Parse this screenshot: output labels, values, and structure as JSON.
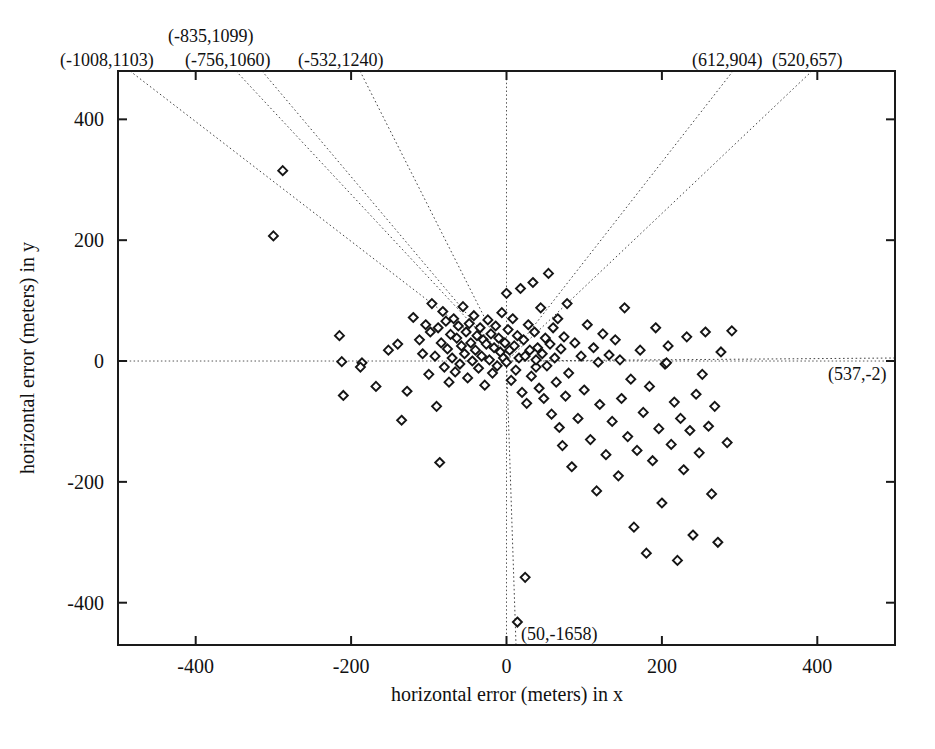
{
  "figure": {
    "name": "horizontal-error-scatter",
    "background": "#ffffff",
    "ink": "#111111"
  },
  "chart_data": {
    "type": "scatter",
    "title": "",
    "xlabel": "horizontal error (meters) in x",
    "ylabel": "horizontal error (meters) in y",
    "xlim": [
      -500,
      500
    ],
    "ylim": [
      -470,
      480
    ],
    "xticks": [
      -400,
      -200,
      0,
      200,
      400
    ],
    "yticks": [
      400,
      200,
      0,
      -200,
      -400
    ],
    "xticklabels": [
      "-400",
      "-200",
      "0",
      "200",
      "400"
    ],
    "yticklabels": [
      "400",
      "200",
      "0",
      "-200",
      "-400"
    ],
    "grid": false,
    "legend": null,
    "marker": "open-diamond",
    "marker_size": 9,
    "points": [
      [
        -300,
        207
      ],
      [
        -288,
        315
      ],
      [
        -215,
        42
      ],
      [
        -212,
        -1
      ],
      [
        -210,
        -57
      ],
      [
        -168,
        -42
      ],
      [
        -152,
        18
      ],
      [
        -140,
        28
      ],
      [
        -135,
        -98
      ],
      [
        -128,
        -50
      ],
      [
        -120,
        72
      ],
      [
        -112,
        35
      ],
      [
        -108,
        12
      ],
      [
        -104,
        60
      ],
      [
        -100,
        -22
      ],
      [
        -98,
        48
      ],
      [
        -96,
        95
      ],
      [
        -92,
        8
      ],
      [
        -90,
        -75
      ],
      [
        -88,
        55
      ],
      [
        -86,
        -168
      ],
      [
        -84,
        30
      ],
      [
        -82,
        82
      ],
      [
        -80,
        -10
      ],
      [
        -78,
        66
      ],
      [
        -76,
        20
      ],
      [
        -74,
        -35
      ],
      [
        -72,
        44
      ],
      [
        -70,
        5
      ],
      [
        -68,
        70
      ],
      [
        -66,
        -18
      ],
      [
        -64,
        38
      ],
      [
        -62,
        58
      ],
      [
        -60,
        -5
      ],
      [
        -58,
        25
      ],
      [
        -56,
        90
      ],
      [
        -54,
        12
      ],
      [
        -52,
        48
      ],
      [
        -50,
        -28
      ],
      [
        -48,
        62
      ],
      [
        -46,
        30
      ],
      [
        -44,
        0
      ],
      [
        -42,
        75
      ],
      [
        -40,
        18
      ],
      [
        -38,
        42
      ],
      [
        -36,
        -12
      ],
      [
        -34,
        55
      ],
      [
        -32,
        8
      ],
      [
        -30,
        35
      ],
      [
        -28,
        -40
      ],
      [
        -26,
        28
      ],
      [
        -24,
        68
      ],
      [
        -22,
        2
      ],
      [
        -20,
        45
      ],
      [
        -18,
        -20
      ],
      [
        -16,
        22
      ],
      [
        -14,
        58
      ],
      [
        -12,
        -8
      ],
      [
        -10,
        38
      ],
      [
        -8,
        15
      ],
      [
        -6,
        80
      ],
      [
        -4,
        5
      ],
      [
        -2,
        30
      ],
      [
        0,
        -2
      ],
      [
        0,
        112
      ],
      [
        2,
        52
      ],
      [
        4,
        18
      ],
      [
        6,
        -32
      ],
      [
        8,
        70
      ],
      [
        10,
        25
      ],
      [
        12,
        -15
      ],
      [
        14,
        42
      ],
      [
        16,
        5
      ],
      [
        18,
        120
      ],
      [
        20,
        -52
      ],
      [
        22,
        35
      ],
      [
        24,
        8
      ],
      [
        26,
        -70
      ],
      [
        28,
        60
      ],
      [
        30,
        18
      ],
      [
        32,
        -25
      ],
      [
        34,
        130
      ],
      [
        36,
        48
      ],
      [
        38,
        -10
      ],
      [
        40,
        22
      ],
      [
        42,
        -45
      ],
      [
        44,
        88
      ],
      [
        46,
        12
      ],
      [
        48,
        -62
      ],
      [
        50,
        38
      ],
      [
        52,
        -8
      ],
      [
        54,
        145
      ],
      [
        56,
        28
      ],
      [
        58,
        -88
      ],
      [
        60,
        55
      ],
      [
        62,
        5
      ],
      [
        64,
        -35
      ],
      [
        66,
        70
      ],
      [
        68,
        -110
      ],
      [
        70,
        20
      ],
      [
        72,
        -140
      ],
      [
        74,
        40
      ],
      [
        76,
        -58
      ],
      [
        78,
        95
      ],
      [
        80,
        -20
      ],
      [
        84,
        -175
      ],
      [
        88,
        30
      ],
      [
        92,
        -95
      ],
      [
        96,
        8
      ],
      [
        100,
        -48
      ],
      [
        104,
        60
      ],
      [
        108,
        -130
      ],
      [
        112,
        22
      ],
      [
        116,
        -215
      ],
      [
        120,
        -72
      ],
      [
        124,
        45
      ],
      [
        128,
        -155
      ],
      [
        132,
        10
      ],
      [
        136,
        -100
      ],
      [
        140,
        35
      ],
      [
        144,
        -190
      ],
      [
        148,
        -62
      ],
      [
        152,
        88
      ],
      [
        156,
        -125
      ],
      [
        160,
        -30
      ],
      [
        164,
        -275
      ],
      [
        168,
        -148
      ],
      [
        172,
        18
      ],
      [
        176,
        -85
      ],
      [
        180,
        -318
      ],
      [
        184,
        -42
      ],
      [
        188,
        -165
      ],
      [
        192,
        55
      ],
      [
        196,
        -112
      ],
      [
        200,
        -235
      ],
      [
        204,
        -5
      ],
      [
        208,
        25
      ],
      [
        212,
        -138
      ],
      [
        216,
        -68
      ],
      [
        220,
        -330
      ],
      [
        224,
        -95
      ],
      [
        228,
        -180
      ],
      [
        232,
        40
      ],
      [
        236,
        -115
      ],
      [
        240,
        -288
      ],
      [
        244,
        -55
      ],
      [
        248,
        -152
      ],
      [
        252,
        -22
      ],
      [
        256,
        48
      ],
      [
        260,
        -108
      ],
      [
        264,
        -220
      ],
      [
        268,
        -75
      ],
      [
        272,
        -300
      ],
      [
        276,
        15
      ],
      [
        284,
        -135
      ],
      [
        290,
        50
      ],
      [
        24,
        -358
      ],
      [
        14,
        -432
      ],
      [
        -186,
        -3
      ],
      [
        -188,
        -10
      ],
      [
        118,
        -2
      ],
      [
        206,
        -3
      ],
      [
        146,
        2
      ],
      [
        38,
        2
      ]
    ],
    "callouts": [
      {
        "text": "(-1008,1103)",
        "x": -1008,
        "y": 1103,
        "anchor_px_x": 60,
        "anchor_px_y": 66,
        "edge_x": 130,
        "edge_y": 71
      },
      {
        "text": "(-835,1099)",
        "x": -835,
        "y": 1099,
        "anchor_px_x": 168,
        "anchor_px_y": 42,
        "edge_x": 236,
        "edge_y": 71
      },
      {
        "text": "(-756,1060)",
        "x": -756,
        "y": 1060,
        "anchor_px_x": 185,
        "anchor_px_y": 66,
        "edge_x": 262,
        "edge_y": 71
      },
      {
        "text": "(-532,1240)",
        "x": -532,
        "y": 1240,
        "anchor_px_x": 298,
        "anchor_px_y": 66,
        "edge_x": 360,
        "edge_y": 71
      },
      {
        "text": "(612,904)",
        "x": 612,
        "y": 904,
        "anchor_px_x": 692,
        "anchor_px_y": 66,
        "edge_x": 733,
        "edge_y": 71
      },
      {
        "text": "(520,657)",
        "x": 520,
        "y": 657,
        "anchor_px_x": 772,
        "anchor_px_y": 66,
        "edge_x": 812,
        "edge_y": 71
      },
      {
        "text": "(537,-2)",
        "x": 537,
        "y": -2,
        "anchor_px_x": 828,
        "anchor_px_y": 380,
        "edge_x": 895,
        "edge_y": 358
      },
      {
        "text": "(50,-1658)",
        "x": 50,
        "y": -1658,
        "anchor_px_x": 521,
        "anchor_px_y": 640,
        "edge_x": 516,
        "edge_y": 645
      }
    ]
  },
  "axes": {
    "x_title": "horizontal error (meters) in x",
    "y_title": "horizontal error (meters) in y"
  }
}
